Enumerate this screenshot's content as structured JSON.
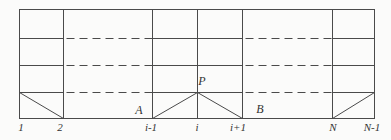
{
  "figure": {
    "colors": {
      "background": "#fbfbfa",
      "line": "#4a4a4a",
      "text": "#333333"
    },
    "labels": {
      "node_first": "1",
      "node_second": "2",
      "node_im1": "i-1",
      "node_i": "i",
      "node_ip1": "i+1",
      "node_N": "N",
      "node_last": "N-1",
      "point_A": "A",
      "point_P": "P",
      "point_B": "B"
    }
  }
}
